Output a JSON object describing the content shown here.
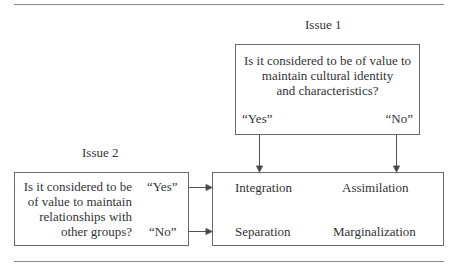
{
  "figure": {
    "issue1": {
      "label": "Issue 1",
      "question_lines": [
        "Is it considered to be of value to",
        "maintain cultural identity",
        "and characteristics?"
      ],
      "answer_yes": "“Yes”",
      "answer_no": "“No”"
    },
    "issue2": {
      "label": "Issue 2",
      "question_lines": [
        "Is it considered to be",
        "of value to maintain",
        "relationships with",
        "other groups?"
      ],
      "answer_yes": "“Yes”",
      "answer_no": "“No”"
    },
    "outcomes": {
      "integration": "Integration",
      "assimilation": "Assimilation",
      "separation": "Separation",
      "marginalization": "Marginalization"
    },
    "colors": {
      "text": "#333333",
      "lines": "#6a6a6a",
      "rules": "#8a8a8a"
    }
  }
}
